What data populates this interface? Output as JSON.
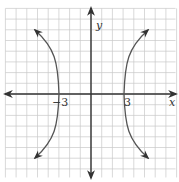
{
  "chart_data": {
    "type": "line",
    "title": "",
    "xlabel": "x",
    "ylabel": "y",
    "xlim": [
      -8,
      8
    ],
    "ylim": [
      -8,
      8
    ],
    "grid": true,
    "tick_labels": {
      "x": [
        "-3",
        "3"
      ]
    },
    "vertices": [
      [
        -3,
        0
      ],
      [
        3,
        0
      ]
    ],
    "series": [
      {
        "name": "right branch",
        "x": [
          4.5,
          3.6,
          3.1,
          3,
          3.1,
          3.6,
          4.5
        ],
        "y": [
          7,
          4.5,
          2,
          0,
          -2,
          -4.5,
          -7
        ]
      },
      {
        "name": "left branch",
        "x": [
          -4.5,
          -3.6,
          -3.1,
          -3,
          -3.1,
          -3.6,
          -4.5
        ],
        "y": [
          7,
          4.5,
          2,
          0,
          -2,
          -4.5,
          -7
        ]
      }
    ]
  },
  "labels": {
    "x_axis": "x",
    "y_axis": "y",
    "tick_neg": "−3",
    "tick_pos": "3"
  }
}
